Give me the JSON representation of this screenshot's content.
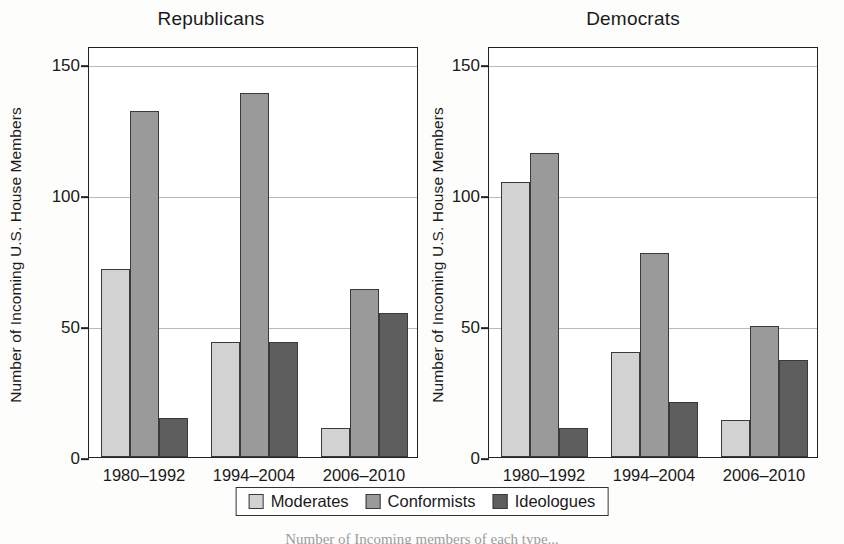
{
  "figure": {
    "ylabel": "Number of Incoming U.S. House Members",
    "caption_partial": "Number of Incoming members of each type..."
  },
  "legend": {
    "items": [
      {
        "label": "Moderates",
        "key": "moderates",
        "color": "#d2d2d2"
      },
      {
        "label": "Conformists",
        "key": "conformists",
        "color": "#9a9a9a"
      },
      {
        "label": "Ideologues",
        "key": "ideologues",
        "color": "#5e5e5e"
      }
    ]
  },
  "chart_data": [
    {
      "type": "bar",
      "title": "Republicans",
      "xlabel": "",
      "ylabel": "Number of Incoming U.S. House Members",
      "categories": [
        "1980–1992",
        "1994–2004",
        "2006–2010"
      ],
      "yticks": [
        0,
        50,
        100,
        150
      ],
      "ylim": [
        0,
        157
      ],
      "grid": true,
      "legend_position": "bottom-center",
      "series": [
        {
          "name": "Moderates",
          "values": [
            72,
            44,
            11
          ]
        },
        {
          "name": "Conformists",
          "values": [
            132,
            139,
            64
          ]
        },
        {
          "name": "Ideologues",
          "values": [
            15,
            44,
            55
          ]
        }
      ]
    },
    {
      "type": "bar",
      "title": "Democrats",
      "xlabel": "",
      "ylabel": "Number of Incoming U.S. House Members",
      "categories": [
        "1980–1992",
        "1994–2004",
        "2006–2010"
      ],
      "yticks": [
        0,
        50,
        100,
        150
      ],
      "ylim": [
        0,
        157
      ],
      "grid": true,
      "legend_position": "bottom-center",
      "series": [
        {
          "name": "Moderates",
          "values": [
            105,
            40,
            14
          ]
        },
        {
          "name": "Conformists",
          "values": [
            116,
            78,
            50
          ]
        },
        {
          "name": "Ideologues",
          "values": [
            11,
            21,
            37
          ]
        }
      ]
    }
  ]
}
